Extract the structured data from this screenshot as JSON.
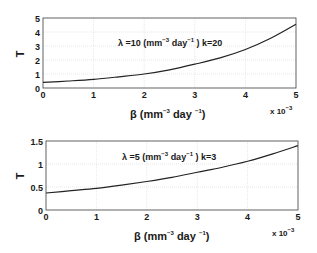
{
  "chart_data": [
    {
      "type": "line",
      "title": "",
      "annotation": {
        "lambda_symbol": "λ",
        "lambda_text": " =10 (mm",
        "exp1": "−3",
        "mid": " day",
        "exp2": "−1",
        "tail": " )  k=20"
      },
      "xlabel": {
        "symbol": "β",
        "text": " (mm",
        "exp1": "−3",
        "mid": " day ",
        "exp2": "−1",
        "tail": ")"
      },
      "ylabel": "T",
      "x_multiplier": {
        "text": "x 10",
        "exp": "−3"
      },
      "xlim": [
        0,
        5
      ],
      "ylim": [
        0,
        5
      ],
      "xticks": [
        "0",
        "1",
        "2",
        "3",
        "4",
        "5"
      ],
      "yticks": [
        "0",
        "1",
        "2",
        "3",
        "4",
        "5"
      ],
      "grid": true,
      "x": [
        0,
        0.5,
        1,
        1.5,
        2,
        2.5,
        3,
        3.5,
        4,
        4.5,
        5
      ],
      "series": [
        {
          "name": "T",
          "values": [
            0.4,
            0.5,
            0.62,
            0.8,
            1.0,
            1.3,
            1.7,
            2.15,
            2.75,
            3.55,
            4.55
          ]
        }
      ],
      "frame": {
        "x0": 43,
        "x1": 296,
        "y0": 18,
        "y1": 88
      }
    },
    {
      "type": "line",
      "title": "",
      "annotation": {
        "lambda_symbol": "λ",
        "lambda_text": " =5 (mm",
        "exp1": "−3",
        "mid": "  day",
        "exp2": "−1",
        "tail": " )  k=3"
      },
      "xlabel": {
        "symbol": "β",
        "text": " (mm",
        "exp1": "−3",
        "mid": " day ",
        "exp2": "−1",
        "tail": ")"
      },
      "ylabel": "T",
      "x_multiplier": {
        "text": "x 10",
        "exp": "−3"
      },
      "xlim": [
        0,
        5
      ],
      "ylim": [
        0,
        1.5
      ],
      "xticks": [
        "0",
        "1",
        "2",
        "3",
        "4",
        "5"
      ],
      "yticks": [
        "0",
        "0.5",
        "1",
        "1.5"
      ],
      "grid": true,
      "x": [
        0,
        0.5,
        1,
        1.5,
        2,
        2.5,
        3,
        3.5,
        4,
        4.5,
        5
      ],
      "series": [
        {
          "name": "T",
          "values": [
            0.37,
            0.42,
            0.47,
            0.54,
            0.62,
            0.71,
            0.82,
            0.93,
            1.06,
            1.22,
            1.4
          ]
        }
      ],
      "frame": {
        "x0": 46,
        "x1": 298,
        "y0": 141,
        "y1": 210
      }
    }
  ]
}
